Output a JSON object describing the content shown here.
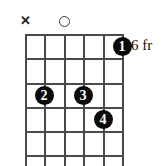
{
  "diagram": {
    "type": "guitar-chord-diagram",
    "fret_position_label": "6 fr",
    "strings_count": 6,
    "frets_count": 5,
    "grid": {
      "left": 25,
      "right": 122,
      "top": 34,
      "string_spacing": 19.4,
      "fret_spacing": 24.2
    },
    "colors": {
      "grid": "#4a4a4a",
      "dot_fill": "#0a0a0a",
      "dot_text": "#ffffff",
      "marker": "#222222",
      "background": "#ffffff"
    },
    "open_muted_markers": [
      {
        "name": "muted-string-1",
        "symbol": "✕",
        "kind": "muted",
        "string_index": 0,
        "x": 25,
        "y": 21
      },
      {
        "name": "open-string-3",
        "symbol": "",
        "kind": "open",
        "string_index": 2,
        "x": 64,
        "y": 21
      }
    ],
    "finger_dots": [
      {
        "label": "1",
        "string_index": 5,
        "fret_index": 0,
        "x": 122,
        "y": 46
      },
      {
        "label": "2",
        "string_index": 1,
        "fret_index": 2,
        "x": 44,
        "y": 95
      },
      {
        "label": "3",
        "string_index": 3,
        "fret_index": 2,
        "x": 83,
        "y": 95
      },
      {
        "label": "4",
        "string_index": 4,
        "fret_index": 3,
        "x": 103,
        "y": 119
      }
    ],
    "fret_lines_y": [
      34,
      58,
      83,
      107,
      131,
      155
    ],
    "strings_x": [
      25,
      44,
      64,
      83,
      103,
      122
    ],
    "fret_label_pos": {
      "x": 131,
      "y": 38
    }
  }
}
